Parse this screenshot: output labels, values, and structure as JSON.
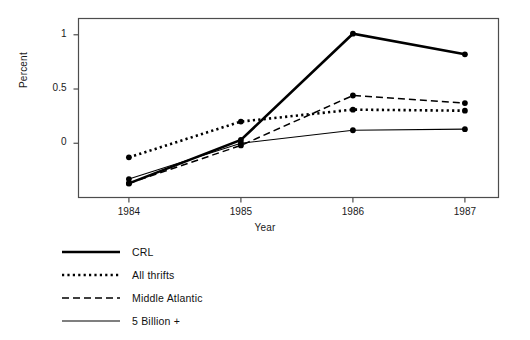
{
  "chart_data": {
    "type": "line",
    "title": "",
    "xlabel": "Year",
    "ylabel": "Percent",
    "categories": [
      "1984",
      "1985",
      "1986",
      "1987"
    ],
    "x": [
      1984,
      1985,
      1986,
      1987
    ],
    "xlim": [
      1983.55,
      1987.3
    ],
    "ylim": [
      -0.5,
      1.15
    ],
    "yticks": [
      0,
      0.5,
      1
    ],
    "ytick_labels": [
      "0",
      "0.5",
      "1"
    ],
    "xticks": [
      1984,
      1985,
      1986,
      1987
    ],
    "xtick_labels": [
      "1984",
      "1985",
      "1986",
      "1987"
    ],
    "grid": false,
    "legend_position": "below-left",
    "markers": "filled-circle",
    "series": [
      {
        "name": "CRL",
        "style": "solid-thick",
        "color": "#000000",
        "values": [
          -0.37,
          0.03,
          1.01,
          0.82
        ]
      },
      {
        "name": "All thrifts",
        "style": "dotted",
        "color": "#000000",
        "values": [
          -0.13,
          0.2,
          0.31,
          0.3
        ]
      },
      {
        "name": "Middle Atlantic",
        "style": "dashed",
        "color": "#000000",
        "values": [
          -0.37,
          -0.02,
          0.44,
          0.37
        ]
      },
      {
        "name": "5 Billion +",
        "style": "solid-thin",
        "color": "#000000",
        "values": [
          -0.33,
          0.0,
          0.12,
          0.13
        ]
      }
    ]
  },
  "axis": {
    "ylabel": "Percent",
    "xlabel": "Year",
    "ytick_labels": [
      "0",
      "0.5",
      "1"
    ],
    "xtick_labels": [
      "1984",
      "1985",
      "1986",
      "1987"
    ]
  },
  "legend": {
    "items": [
      {
        "label": "CRL",
        "style": "solid-thick"
      },
      {
        "label": "All thrifts",
        "style": "dotted"
      },
      {
        "label": "Middle Atlantic",
        "style": "dashed"
      },
      {
        "label": "5 Billion +",
        "style": "solid-thin"
      }
    ]
  },
  "colors": {
    "line": "#000000",
    "axis": "#4d4d4d",
    "background": "#ffffff"
  }
}
